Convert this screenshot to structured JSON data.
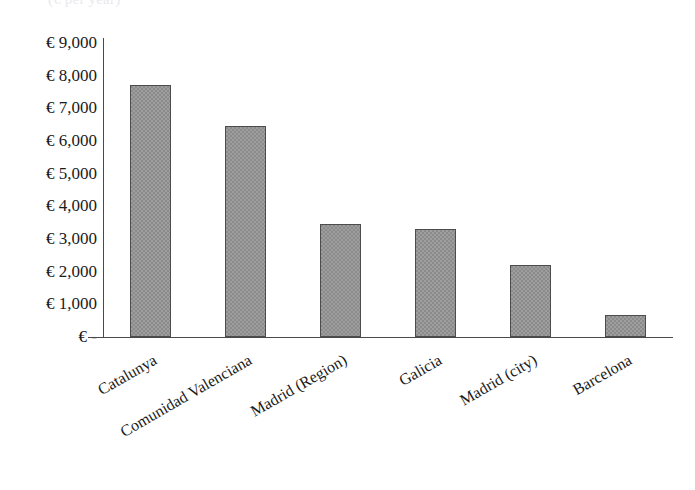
{
  "chart": {
    "title_remnant": "(€ per year)",
    "currency_symbol": "€",
    "zero_label": "€ -"
  },
  "chart_data": {
    "type": "bar",
    "title": "",
    "xlabel": "",
    "ylabel": "",
    "categories": [
      "Catalunya",
      "Comunidad Valenciana",
      "Madrid (Region)",
      "Galicia",
      "Madrid (city)",
      "Barcelona"
    ],
    "values": [
      7700,
      6450,
      3450,
      3300,
      2200,
      680
    ],
    "ylim": [
      0,
      9000
    ],
    "ytick_values": [
      9000,
      8000,
      7000,
      6000,
      5000,
      4000,
      3000,
      2000,
      1000,
      0
    ],
    "ytick_labels": [
      "€ 9,000",
      "€ 8,000",
      "€ 7,000",
      "€ 6,000",
      "€ 5,000",
      "€ 4,000",
      "€ 3,000",
      "€ 2,000",
      "€ 1,000",
      "€ -"
    ],
    "grid": false,
    "legend": false,
    "bar_color": "#8b8b8b",
    "bar_border_color": "#4c4c4c",
    "axis_color": "#4a4a4a"
  }
}
